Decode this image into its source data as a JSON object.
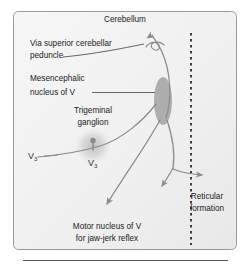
{
  "figure": {
    "type": "neuroanatomy-pathway-diagram",
    "panel": {
      "background_color": "#f2f2f2",
      "border_color": "#9a9a9a",
      "rule_color": "#666666"
    },
    "colors": {
      "fiber": "#8b8b8b",
      "leader": "#555555",
      "nucleus_fill": "#a8a8a8",
      "ganglion_fill": "#c9c9c9",
      "ganglion_dot": "#8a8a8a",
      "midline_dotted": "#333333",
      "text": "#222222"
    },
    "labels": {
      "cerebellum": "Cerebellum",
      "via_superior_cerebellar_peduncle_line1": "Via superior cerebellar",
      "via_superior_cerebellar_peduncle_line2": "peduncle",
      "mesencephalic_nucleus_line1": "Mesencephalic",
      "mesencephalic_nucleus_line2": "nucleus of V",
      "trigeminal_ganglion_line1": "Trigeminal",
      "trigeminal_ganglion_line2": "ganglion",
      "v3_peripheral_main": "V",
      "v3_peripheral_sub": "3",
      "v3_ganglion_main": "V",
      "v3_ganglion_sub": "3",
      "reticular_formation_line1": "Reticular",
      "reticular_formation_line2": "formation",
      "motor_nucleus_line1": "Motor nucleus of V",
      "motor_nucleus_line2": "for jaw-jerk reflex"
    },
    "structures": [
      {
        "name": "mesencephalic-nucleus-of-v",
        "shape": "ellipse",
        "cx": 163,
        "cy": 101,
        "rx": 9,
        "ry": 24,
        "fill": "#a8a8a8"
      },
      {
        "name": "trigeminal-ganglion",
        "shape": "radial-blob",
        "cx": 93,
        "cy": 146,
        "r": 18,
        "fill": "#c9c9c9"
      },
      {
        "name": "ganglion-cell-body",
        "shape": "dot",
        "cx": 93,
        "cy": 141,
        "r": 2.6,
        "fill": "#8a8a8a"
      }
    ],
    "pathways": [
      {
        "name": "v3-afferent-to-mesencephalic-nucleus",
        "description": "V3 peripheral fiber curving from lower left up to the mesencephalic nucleus"
      },
      {
        "name": "ascending-to-cerebellum",
        "description": "Fiber ascending from nucleus to cerebellum via superior cerebellar peduncle, arrowhead up"
      },
      {
        "name": "descending-to-motor-nucleus",
        "description": "Fiber descending left from nucleus to motor nucleus of V, arrowhead down"
      },
      {
        "name": "descending-to-reticular-formation",
        "description": "Fiber descending right from nucleus, branching toward reticular formation and crossing midline"
      }
    ],
    "midline": {
      "name": "midline",
      "style": "dotted",
      "x": 191,
      "y_top": 33,
      "y_bottom": 245
    }
  }
}
